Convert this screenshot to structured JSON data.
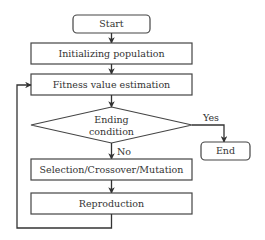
{
  "diagram": {
    "type": "flowchart",
    "colors": {
      "stroke": "#444444",
      "text": "#333333",
      "background": "#ffffff"
    },
    "nodes": [
      {
        "id": "start",
        "shape": "rounded-rect",
        "label": "Start"
      },
      {
        "id": "init",
        "shape": "rect",
        "label": "Initializing population"
      },
      {
        "id": "fitness",
        "shape": "rect",
        "label": "Fitness value estimation"
      },
      {
        "id": "ending",
        "shape": "diamond",
        "label_line1": "Ending",
        "label_line2": "condition"
      },
      {
        "id": "end",
        "shape": "rounded-rect",
        "label": "End"
      },
      {
        "id": "select",
        "shape": "rect",
        "label": "Selection/Crossover/Mutation"
      },
      {
        "id": "repro",
        "shape": "rect",
        "label": "Reproduction"
      }
    ],
    "edges": [
      {
        "from": "start",
        "to": "init",
        "label": ""
      },
      {
        "from": "init",
        "to": "fitness",
        "label": ""
      },
      {
        "from": "fitness",
        "to": "ending",
        "label": ""
      },
      {
        "from": "ending",
        "to": "end",
        "label": "Yes"
      },
      {
        "from": "ending",
        "to": "select",
        "label": "No"
      },
      {
        "from": "select",
        "to": "repro",
        "label": ""
      },
      {
        "from": "repro",
        "to": "fitness",
        "label": "",
        "type": "loop-back"
      }
    ]
  }
}
